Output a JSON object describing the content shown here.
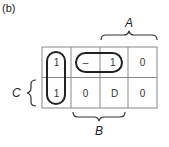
{
  "figure": {
    "label": "(b)",
    "variables": {
      "A": "A",
      "B": "B",
      "C": "C"
    },
    "kmap": {
      "rows": 2,
      "cols": 4,
      "cells": [
        [
          "1",
          "–",
          "1",
          "0"
        ],
        [
          "1",
          "0",
          "D",
          "0"
        ]
      ],
      "groups": [
        {
          "name": "vertical-loop",
          "cells": [
            [
              0,
              0
            ],
            [
              1,
              0
            ]
          ]
        },
        {
          "name": "horizontal-loop",
          "cells": [
            [
              0,
              1
            ],
            [
              0,
              2
            ]
          ]
        }
      ]
    },
    "colors": {
      "line": "#333333",
      "grid": "#888888",
      "background": "#ffffff"
    }
  }
}
